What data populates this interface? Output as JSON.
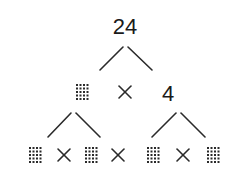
{
  "diagram": {
    "type": "factor-tree",
    "root": {
      "label": "24",
      "x": 125,
      "y": 34
    },
    "level1": {
      "left_factor": {
        "label": "",
        "kind": "blank-box",
        "x": 76,
        "y": 84
      },
      "operator": {
        "label": "×",
        "x": 125,
        "y": 92
      },
      "right_factor": {
        "label": "4",
        "x": 168,
        "y": 101
      }
    },
    "level2": [
      {
        "kind": "blank-box",
        "x": 29,
        "y": 147
      },
      {
        "kind": "operator",
        "label": "×"
      },
      {
        "kind": "blank-box",
        "x": 85,
        "y": 147
      },
      {
        "kind": "operator",
        "label": "×"
      },
      {
        "kind": "blank-box",
        "x": 140,
        "y": 147
      },
      {
        "kind": "operator",
        "label": "×"
      },
      {
        "kind": "blank-box",
        "x": 207,
        "y": 147
      }
    ],
    "colors": {
      "ink": "#2a2a2a",
      "background": "#ffffff"
    }
  }
}
